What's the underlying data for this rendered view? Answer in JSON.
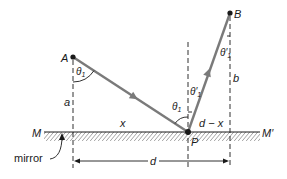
{
  "colors": {
    "ray": "#7a7a7a",
    "ink": "#1a1a1a",
    "hatch": "#555555"
  },
  "points": {
    "A": "A",
    "B": "B",
    "P": "P"
  },
  "mirror": {
    "left_label": "M",
    "right_label": "M′",
    "caption": "mirror"
  },
  "distances": {
    "a": "a",
    "b": "b",
    "x": "x",
    "d_minus_x": "d − x",
    "d": "d"
  },
  "angles": {
    "theta_at_A": "θ",
    "theta_at_A_sub": "1",
    "theta_at_P_incident": "θ",
    "theta_at_P_incident_sub": "1",
    "theta_at_P_reflected": "θ′",
    "theta_at_P_reflected_sub": "1",
    "theta_at_B": "θ′",
    "theta_at_B_sub": "1"
  }
}
